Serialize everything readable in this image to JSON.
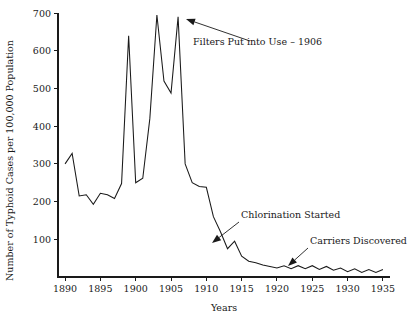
{
  "chart_data": {
    "type": "line",
    "title": "",
    "xlabel": "Years",
    "ylabel": "Number of Typhoid Cases per 100,000 Population",
    "xlim": [
      1889,
      1936
    ],
    "ylim": [
      0,
      700
    ],
    "xticks": [
      1890,
      1895,
      1900,
      1905,
      1910,
      1915,
      1920,
      1925,
      1930,
      1935
    ],
    "xtick_labels": [
      "1890",
      "1895",
      "1900",
      "1905",
      "1910",
      "1915",
      "1920",
      "1925",
      "1930",
      "1935"
    ],
    "yticks": [
      100,
      200,
      300,
      400,
      500,
      600,
      700
    ],
    "ytick_labels": [
      "100",
      "200",
      "300",
      "400",
      "500",
      "600",
      "700"
    ],
    "grid": false,
    "legend": null,
    "series": [
      {
        "name": "Typhoid cases per 100,000 population",
        "color": "#1a1a1a",
        "x": [
          1890,
          1891,
          1892,
          1893,
          1894,
          1895,
          1896,
          1897,
          1898,
          1899,
          1900,
          1901,
          1902,
          1903,
          1904,
          1905,
          1906,
          1907,
          1908,
          1909,
          1910,
          1911,
          1912,
          1913,
          1914,
          1915,
          1916,
          1917,
          1918,
          1919,
          1920,
          1921,
          1922,
          1923,
          1924,
          1925,
          1926,
          1927,
          1928,
          1929,
          1930,
          1931,
          1932,
          1933,
          1934,
          1935
        ],
        "values": [
          300,
          328,
          215,
          218,
          193,
          222,
          218,
          208,
          248,
          640,
          250,
          262,
          420,
          695,
          520,
          488,
          690,
          300,
          250,
          240,
          238,
          160,
          120,
          75,
          95,
          55,
          42,
          38,
          32,
          28,
          24,
          30,
          22,
          30,
          22,
          30,
          20,
          28,
          18,
          24,
          14,
          22,
          12,
          20,
          12,
          20
        ]
      }
    ],
    "annotations": [
      {
        "id": "filters-annotation",
        "label": "Filters Put into Use – 1906",
        "text_x": 193,
        "text_y": 45,
        "arrow_from_x": 250,
        "arrow_from_y": 41,
        "arrow_to_x": 186,
        "arrow_to_y": 19
      },
      {
        "id": "chlorination-annotation",
        "label": "Chlorination Started",
        "text_x": 241,
        "text_y": 218,
        "arrow_from_x": 239,
        "arrow_from_y": 222,
        "arrow_to_x": 212,
        "arrow_to_y": 243
      },
      {
        "id": "carriers-annotation",
        "label": "Carriers Discovered",
        "text_x": 310,
        "text_y": 244,
        "arrow_from_x": 308,
        "arrow_from_y": 248,
        "arrow_to_x": 288,
        "arrow_to_y": 266
      }
    ]
  },
  "axis": {
    "x_title": "Years",
    "y_title": "Number of Typhoid Cases per 100,000 Population"
  }
}
